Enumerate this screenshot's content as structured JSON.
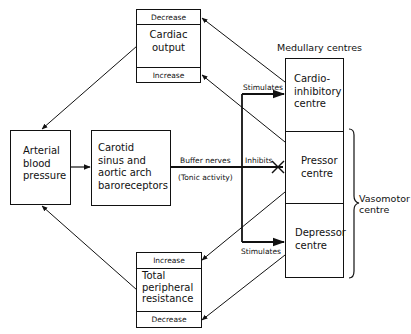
{
  "diagram": {
    "cardiac_output": {
      "top_label": "Decrease",
      "name": "Cardiac output",
      "name_lines": [
        "Cardiac",
        "output"
      ],
      "bottom_label": "Increase"
    },
    "arterial_blood_pressure": {
      "name_lines": [
        "Arterial",
        "blood",
        "pressure"
      ]
    },
    "baroreceptors": {
      "name_lines": [
        "Carotid",
        "sinus and",
        "aortic arch",
        "baroreceptors"
      ]
    },
    "buffer_nerves": {
      "label": "Buffer nerves",
      "sublabel": "(Tonic activity)"
    },
    "medullary_centres": {
      "title": "Medullary centres",
      "cardio_inhibitory": [
        "Cardio-",
        "inhibitory",
        "centre"
      ],
      "pressor": [
        "Pressor",
        "centre"
      ],
      "depressor": [
        "Depressor",
        "centre"
      ]
    },
    "vasomotor": {
      "label_lines": [
        "Vasomotor",
        "centre"
      ]
    },
    "edges": {
      "stimulates_top": "Stimulates",
      "inhibits": "Inhibits",
      "stimulates_bottom": "Stimulates"
    },
    "total_peripheral_resistance": {
      "top_label": "Increase",
      "name_lines": [
        "Total",
        "peripheral",
        "resistance"
      ],
      "bottom_label": "Decrease"
    }
  }
}
